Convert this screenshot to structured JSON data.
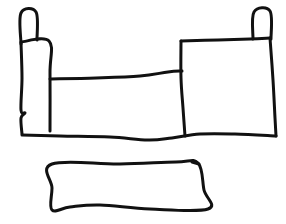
{
  "canvas": {
    "width": 286,
    "height": 224,
    "background_color": "#ffffff",
    "ink_color": "#111111",
    "style": "hand-drawn line sketch, black marker on white, no text labels"
  },
  "figure": {
    "title": "",
    "shapes": [
      {
        "id": "left-chimney",
        "name": "left-chimney",
        "stroke_width": 3,
        "closed": false,
        "points": [
          [
            21,
            44
          ],
          [
            21,
            13
          ],
          [
            36,
            12
          ],
          [
            37,
            40
          ]
        ]
      },
      {
        "id": "left-post",
        "name": "left-post",
        "stroke_width": 3,
        "closed": false,
        "points": [
          [
            21,
            42
          ],
          [
            49,
            41
          ],
          [
            50,
            73
          ],
          [
            50,
            131
          ]
        ]
      },
      {
        "id": "left-post-outer-edge",
        "name": "left-post-outer-edge",
        "stroke_width": 3,
        "closed": false,
        "points": [
          [
            21,
            43
          ],
          [
            22,
            78
          ],
          [
            21,
            110
          ],
          [
            25,
            113
          ],
          [
            21,
            118
          ],
          [
            22,
            134
          ]
        ]
      },
      {
        "id": "main-top-rail",
        "name": "main-top-rail",
        "stroke_width": 3,
        "closed": false,
        "points": [
          [
            50,
            79
          ],
          [
            96,
            78
          ],
          [
            140,
            76
          ],
          [
            168,
            72
          ],
          [
            182,
            71
          ]
        ]
      },
      {
        "id": "right-body-left-edge",
        "name": "right-body-left-edge",
        "stroke_width": 3,
        "closed": false,
        "points": [
          [
            181,
            41
          ],
          [
            181,
            78
          ],
          [
            183,
            108
          ],
          [
            185,
            136
          ]
        ]
      },
      {
        "id": "right-body-top-edge",
        "name": "right-body-top-edge",
        "stroke_width": 3,
        "closed": false,
        "points": [
          [
            181,
            41
          ],
          [
            218,
            40
          ],
          [
            250,
            39
          ],
          [
            270,
            38
          ]
        ]
      },
      {
        "id": "right-chimney",
        "name": "right-chimney",
        "stroke_width": 3,
        "closed": false,
        "points": [
          [
            253,
            39
          ],
          [
            254,
            12
          ],
          [
            270,
            11
          ],
          [
            271,
            39
          ]
        ]
      },
      {
        "id": "right-body-right-edge",
        "name": "right-body-right-edge",
        "stroke_width": 3,
        "closed": false,
        "points": [
          [
            270,
            38
          ],
          [
            273,
            80
          ],
          [
            275,
            118
          ],
          [
            276,
            136
          ]
        ]
      },
      {
        "id": "main-bottom-edge",
        "name": "main-bottom-edge",
        "stroke_width": 3,
        "closed": false,
        "points": [
          [
            22,
            135
          ],
          [
            60,
            136
          ],
          [
            110,
            137
          ],
          [
            148,
            140
          ],
          [
            172,
            138
          ],
          [
            200,
            134
          ],
          [
            235,
            134
          ],
          [
            276,
            136
          ]
        ]
      },
      {
        "id": "lower-bar",
        "name": "lower-bar",
        "stroke_width": 3,
        "closed": true,
        "points": [
          [
            52,
            164
          ],
          [
            120,
            164
          ],
          [
            176,
            162
          ],
          [
            198,
            163
          ],
          [
            204,
            190
          ],
          [
            208,
            209
          ],
          [
            150,
            209
          ],
          [
            100,
            205
          ],
          [
            70,
            207
          ],
          [
            52,
            210
          ],
          [
            52,
            188
          ]
        ]
      },
      {
        "id": "lower-bar-right-tick",
        "name": "lower-bar-right-tick",
        "stroke_width": 3,
        "closed": false,
        "points": [
          [
            192,
            162
          ],
          [
            199,
            164
          ]
        ]
      }
    ]
  }
}
